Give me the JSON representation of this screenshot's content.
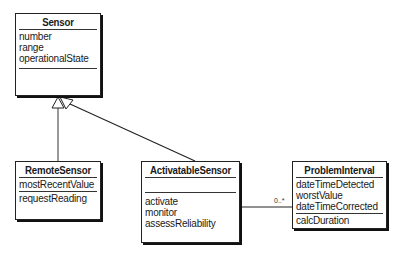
{
  "diagram": {
    "type": "UML class diagram",
    "classes": [
      {
        "name": "Sensor",
        "attributes": [
          "number",
          "range",
          "operationalState"
        ],
        "operations": []
      },
      {
        "name": "RemoteSensor",
        "attributes": [
          "mostRecentValue"
        ],
        "operations": [
          "requestReading"
        ]
      },
      {
        "name": "ActivatableSensor",
        "attributes": [],
        "operations": [
          "activate",
          "monitor",
          "assessReliability"
        ]
      },
      {
        "name": "ProblemInterval",
        "attributes": [
          "dateTimeDetected",
          "worstValue",
          "dateTimeCorrected"
        ],
        "operations": [
          "calcDuration"
        ]
      }
    ],
    "relationships": [
      {
        "type": "generalization",
        "from": "RemoteSensor",
        "to": "Sensor"
      },
      {
        "type": "generalization",
        "from": "ActivatableSensor",
        "to": "Sensor"
      },
      {
        "type": "association",
        "from": "ActivatableSensor",
        "to": "ProblemInterval",
        "multiplicity_to": "0..*"
      }
    ]
  }
}
